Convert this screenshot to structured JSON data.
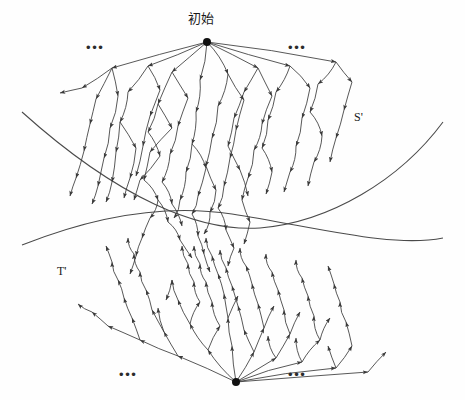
{
  "figure": {
    "title_label": "初始",
    "background_color": "#fefefe",
    "stroke_color": "#3a3a3a",
    "node_color": "#111111",
    "width": 465,
    "height": 400
  },
  "labels": {
    "root_top": "初始",
    "curve_upper": "S'",
    "curve_lower": "T'",
    "ellipsis_top_left": "•••",
    "ellipsis_top_right": "•••",
    "ellipsis_bottom_left": "•••",
    "ellipsis_bottom_right": "•••"
  },
  "chart_data": {
    "type": "diagram",
    "title": "初始",
    "regions": [
      {
        "name": "S'",
        "label": "S'",
        "label_x": 357,
        "label_y": 118
      },
      {
        "name": "T'",
        "label": "T'",
        "label_x": 60,
        "label_y": 272
      }
    ],
    "roots": [
      {
        "name": "forward-root",
        "label": "初始",
        "x": 207,
        "y": 42,
        "radius": 4
      },
      {
        "name": "backward-root",
        "label": "",
        "x": 236,
        "y": 382,
        "radius": 4
      }
    ],
    "ellipses": [
      {
        "name": "ellipsis-top-left",
        "x": 95,
        "y": 48
      },
      {
        "name": "ellipsis-top-right",
        "x": 297,
        "y": 48
      },
      {
        "name": "ellipsis-bottom-left",
        "x": 128,
        "y": 375
      },
      {
        "name": "ellipsis-bottom-right",
        "x": 297,
        "y": 375
      }
    ],
    "curves": [
      {
        "name": "curve-s-prime",
        "label": "S'",
        "path": "M 22,112 C 120,200 200,232 260,228 C 330,222 400,180 443,122"
      },
      {
        "name": "curve-t-prime",
        "label": "T'",
        "path": "M 22,245 C 110,210 180,206 232,214 C 320,228 392,248 443,238"
      }
    ],
    "forward_tree": {
      "direction": "downward",
      "root": [
        207,
        42
      ],
      "edges": [
        [
          207,
          42,
          112,
          68
        ],
        [
          112,
          68,
          82,
          88
        ],
        [
          82,
          88,
          60,
          93
        ],
        [
          112,
          68,
          96,
          99
        ],
        [
          96,
          99,
          90,
          124
        ],
        [
          90,
          124,
          84,
          151
        ],
        [
          112,
          68,
          118,
          96
        ],
        [
          118,
          96,
          110,
          128
        ],
        [
          110,
          128,
          104,
          158
        ],
        [
          207,
          42,
          148,
          66
        ],
        [
          148,
          66,
          128,
          92
        ],
        [
          128,
          92,
          120,
          122
        ],
        [
          120,
          122,
          116,
          152
        ],
        [
          148,
          66,
          160,
          90
        ],
        [
          160,
          90,
          150,
          116
        ],
        [
          150,
          116,
          143,
          146
        ],
        [
          207,
          42,
          172,
          72
        ],
        [
          172,
          72,
          158,
          104
        ],
        [
          158,
          104,
          172,
          128
        ],
        [
          172,
          128,
          150,
          152
        ],
        [
          172,
          72,
          188,
          98
        ],
        [
          188,
          98,
          178,
          126
        ],
        [
          207,
          42,
          200,
          80
        ],
        [
          200,
          80,
          196,
          112
        ],
        [
          196,
          112,
          192,
          144
        ],
        [
          192,
          144,
          186,
          172
        ],
        [
          207,
          42,
          228,
          74
        ],
        [
          228,
          74,
          218,
          106
        ],
        [
          218,
          106,
          212,
          138
        ],
        [
          228,
          74,
          244,
          100
        ],
        [
          244,
          100,
          236,
          130
        ],
        [
          207,
          42,
          258,
          68
        ],
        [
          258,
          68,
          244,
          92
        ],
        [
          244,
          92,
          234,
          118
        ],
        [
          258,
          68,
          272,
          96
        ],
        [
          272,
          96,
          262,
          124
        ],
        [
          207,
          42,
          290,
          66
        ],
        [
          290,
          66,
          276,
          92
        ],
        [
          276,
          92,
          268,
          120
        ],
        [
          290,
          66,
          310,
          88
        ],
        [
          310,
          88,
          302,
          118
        ],
        [
          207,
          42,
          336,
          62
        ],
        [
          336,
          62,
          318,
          84
        ],
        [
          318,
          84,
          310,
          112
        ],
        [
          336,
          62,
          352,
          82
        ],
        [
          84,
          151,
          76,
          178
        ],
        [
          104,
          158,
          98,
          186
        ],
        [
          116,
          152,
          112,
          182
        ],
        [
          143,
          146,
          136,
          176
        ],
        [
          150,
          152,
          144,
          180
        ],
        [
          120,
          122,
          136,
          148
        ],
        [
          136,
          148,
          130,
          178
        ],
        [
          158,
          104,
          148,
          132
        ],
        [
          148,
          132,
          160,
          156
        ],
        [
          160,
          156,
          140,
          180
        ],
        [
          178,
          126,
          170,
          154
        ],
        [
          170,
          154,
          162,
          182
        ],
        [
          186,
          172,
          180,
          200
        ],
        [
          192,
          144,
          206,
          168
        ],
        [
          206,
          168,
          198,
          196
        ],
        [
          212,
          138,
          206,
          166
        ],
        [
          206,
          166,
          216,
          190
        ],
        [
          236,
          130,
          230,
          158
        ],
        [
          230,
          158,
          224,
          186
        ],
        [
          234,
          118,
          228,
          146
        ],
        [
          228,
          146,
          240,
          170
        ],
        [
          262,
          124,
          254,
          150
        ],
        [
          254,
          150,
          248,
          178
        ],
        [
          268,
          120,
          262,
          148
        ],
        [
          262,
          148,
          272,
          172
        ],
        [
          302,
          118,
          296,
          146
        ],
        [
          296,
          146,
          290,
          172
        ],
        [
          310,
          112,
          322,
          136
        ],
        [
          322,
          136,
          314,
          162
        ],
        [
          352,
          82,
          344,
          110
        ],
        [
          344,
          110,
          336,
          138
        ],
        [
          76,
          178,
          70,
          196
        ],
        [
          98,
          186,
          92,
          204
        ],
        [
          112,
          182,
          106,
          202
        ],
        [
          130,
          178,
          124,
          198
        ],
        [
          140,
          180,
          134,
          200
        ],
        [
          144,
          180,
          158,
          200
        ],
        [
          158,
          200,
          150,
          218
        ],
        [
          162,
          182,
          172,
          204
        ],
        [
          180,
          200,
          174,
          218
        ],
        [
          198,
          196,
          192,
          214
        ],
        [
          216,
          190,
          210,
          212
        ],
        [
          224,
          186,
          218,
          208
        ],
        [
          240,
          170,
          248,
          196
        ],
        [
          248,
          178,
          242,
          200
        ],
        [
          272,
          172,
          266,
          194
        ],
        [
          290,
          172,
          284,
          192
        ],
        [
          314,
          162,
          308,
          186
        ],
        [
          336,
          138,
          330,
          162
        ],
        [
          150,
          218,
          142,
          238
        ],
        [
          142,
          238,
          136,
          256
        ],
        [
          158,
          200,
          168,
          222
        ],
        [
          168,
          222,
          180,
          240
        ],
        [
          172,
          204,
          182,
          226
        ],
        [
          192,
          214,
          198,
          236
        ],
        [
          198,
          236,
          204,
          254
        ],
        [
          210,
          212,
          204,
          234
        ],
        [
          218,
          208,
          226,
          230
        ],
        [
          226,
          230,
          234,
          248
        ],
        [
          242,
          200,
          250,
          222
        ],
        [
          136,
          256,
          130,
          274
        ],
        [
          180,
          240,
          192,
          258
        ],
        [
          204,
          254,
          210,
          272
        ],
        [
          234,
          248,
          228,
          266
        ],
        [
          250,
          222,
          244,
          244
        ]
      ]
    },
    "backward_tree": {
      "direction": "upward",
      "root": [
        236,
        382
      ],
      "edges": [
        [
          236,
          382,
          178,
          356
        ],
        [
          178,
          356,
          140,
          340
        ],
        [
          140,
          340,
          108,
          326
        ],
        [
          178,
          356,
          164,
          332
        ],
        [
          164,
          332,
          152,
          310
        ],
        [
          140,
          340,
          132,
          318
        ],
        [
          132,
          318,
          124,
          298
        ],
        [
          236,
          382,
          208,
          350
        ],
        [
          208,
          350,
          190,
          324
        ],
        [
          190,
          324,
          178,
          300
        ],
        [
          208,
          350,
          220,
          326
        ],
        [
          220,
          326,
          212,
          302
        ],
        [
          236,
          382,
          232,
          346
        ],
        [
          232,
          346,
          228,
          318
        ],
        [
          228,
          318,
          224,
          294
        ],
        [
          236,
          382,
          254,
          352
        ],
        [
          254,
          352,
          264,
          328
        ],
        [
          264,
          328,
          258,
          304
        ],
        [
          254,
          352,
          244,
          330
        ],
        [
          244,
          330,
          238,
          306
        ],
        [
          236,
          382,
          276,
          358
        ],
        [
          276,
          358,
          290,
          334
        ],
        [
          290,
          334,
          284,
          310
        ],
        [
          276,
          358,
          268,
          336
        ],
        [
          236,
          382,
          302,
          362
        ],
        [
          302,
          362,
          320,
          340
        ],
        [
          320,
          340,
          314,
          316
        ],
        [
          302,
          362,
          296,
          338
        ],
        [
          236,
          382,
          336,
          368
        ],
        [
          336,
          368,
          352,
          346
        ],
        [
          352,
          346,
          346,
          322
        ],
        [
          336,
          368,
          328,
          346
        ],
        [
          236,
          382,
          368,
          372
        ],
        [
          368,
          372,
          386,
          352
        ],
        [
          108,
          326,
          92,
          312
        ],
        [
          124,
          298,
          118,
          280
        ],
        [
          152,
          310,
          146,
          290
        ],
        [
          146,
          290,
          140,
          272
        ],
        [
          164,
          332,
          158,
          308
        ],
        [
          178,
          300,
          172,
          280
        ],
        [
          172,
          280,
          166,
          300
        ],
        [
          190,
          324,
          200,
          302
        ],
        [
          200,
          302,
          194,
          282
        ],
        [
          212,
          302,
          206,
          282
        ],
        [
          224,
          294,
          218,
          274
        ],
        [
          228,
          318,
          238,
          296
        ],
        [
          238,
          306,
          232,
          286
        ],
        [
          258,
          304,
          252,
          284
        ],
        [
          264,
          328,
          274,
          306
        ],
        [
          284,
          310,
          278,
          290
        ],
        [
          290,
          334,
          300,
          312
        ],
        [
          314,
          316,
          308,
          296
        ],
        [
          320,
          340,
          330,
          318
        ],
        [
          346,
          322,
          340,
          302
        ],
        [
          92,
          312,
          78,
          304
        ],
        [
          118,
          280,
          112,
          262
        ],
        [
          140,
          272,
          134,
          254
        ],
        [
          194,
          282,
          188,
          264
        ],
        [
          206,
          282,
          200,
          264
        ],
        [
          218,
          274,
          212,
          256
        ],
        [
          232,
          286,
          226,
          268
        ],
        [
          252,
          284,
          246,
          266
        ],
        [
          278,
          290,
          272,
          272
        ],
        [
          308,
          296,
          302,
          278
        ],
        [
          340,
          302,
          334,
          284
        ],
        [
          112,
          262,
          106,
          246
        ],
        [
          134,
          254,
          128,
          238
        ],
        [
          188,
          264,
          182,
          246
        ],
        [
          200,
          264,
          194,
          246
        ],
        [
          212,
          256,
          206,
          238
        ],
        [
          226,
          268,
          220,
          250
        ],
        [
          246,
          266,
          240,
          248
        ],
        [
          272,
          272,
          266,
          254
        ],
        [
          302,
          278,
          296,
          260
        ],
        [
          334,
          284,
          328,
          266
        ]
      ]
    }
  }
}
